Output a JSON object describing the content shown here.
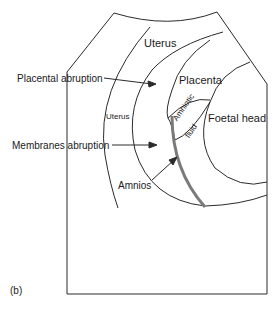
{
  "figure": {
    "panel_label": "(b)",
    "labels": {
      "uterus_top": "Uterus",
      "uterus_inner": "Uterus",
      "placenta": "Placenta",
      "foetal_head": "Foetal head",
      "amniotic_fluid_line1": "Amniotic",
      "amniotic_fluid_line2": "fluid",
      "placental_abruption": "Placental abruption",
      "membranes_abruption": "Membranes abruption",
      "amnios": "Amnios"
    },
    "colors": {
      "line": "#2a2a2a",
      "amnios_band": "#7a7a7a",
      "background": "#ffffff"
    }
  }
}
